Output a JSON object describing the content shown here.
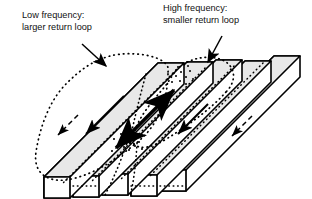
{
  "figure": {
    "type": "technical-illustration",
    "background_color": "#ffffff",
    "line_color": "#000000",
    "bar_top_face_color": "#e8e8e8",
    "bar_front_face_color": "#ffffff",
    "bar_end_face_color": "#ffffff",
    "dotted_loop_color": "#000000"
  },
  "annotations": {
    "low_frequency": {
      "line1": "Low frequency:",
      "line2": "larger return loop",
      "x": 22,
      "y": 18
    },
    "high_frequency": {
      "line1": "High frequency:",
      "line2": "smaller return loop",
      "x": 163,
      "y": 11
    }
  },
  "bars": [
    {
      "id": "bar-1",
      "arrow": "small-left",
      "label": "bar-1"
    },
    {
      "id": "bar-2",
      "arrow": "medium-left",
      "label": "bar-2"
    },
    {
      "id": "bar-3",
      "arrow": "thick-double",
      "label": "bar-3-center"
    },
    {
      "id": "bar-4",
      "arrow": "medium-left",
      "label": "bar-4"
    },
    {
      "id": "bar-5",
      "arrow": "none",
      "label": "bar-5"
    }
  ],
  "current_arrows": {
    "center_bar": "thick double-headed arrow along bar axis",
    "adjacent_bars": "thinner single-headed arrows pointing down-left",
    "outer_bars": "small dashed arrows pointing down-left"
  },
  "return_loops": {
    "low_frequency": "large dotted loop spanning from the center bar out to the first bar",
    "high_frequency": "small dotted loop spanning from the center bar to the neighbouring bar"
  }
}
